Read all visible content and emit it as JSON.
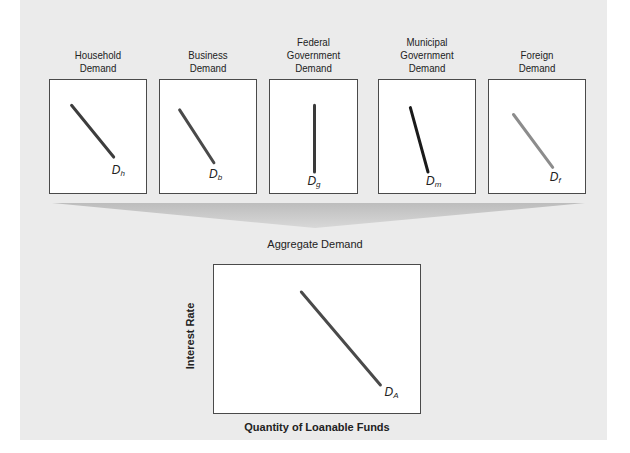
{
  "diagram": {
    "panels": [
      {
        "title_lines": [
          "Household",
          "Demand"
        ],
        "curve_label": "D",
        "curve_sub": "h",
        "curve_color": "#3d3d3d",
        "slope": "downward",
        "x1": 0.22,
        "y1": 0.22,
        "x2": 0.65,
        "y2": 0.67,
        "lx": 0.63,
        "ly": 0.72
      },
      {
        "title_lines": [
          "Business",
          "Demand"
        ],
        "curve_label": "D",
        "curve_sub": "b",
        "curve_color": "#4a4a4a",
        "slope": "downward",
        "x1": 0.2,
        "y1": 0.26,
        "x2": 0.55,
        "y2": 0.72,
        "lx": 0.5,
        "ly": 0.76
      },
      {
        "title_lines": [
          "Federal",
          "Government",
          "Demand"
        ],
        "curve_label": "D",
        "curve_sub": "g",
        "curve_color": "#3a3a3a",
        "slope": "vertical",
        "x1": 0.5,
        "y1": 0.22,
        "x2": 0.5,
        "y2": 0.8,
        "lx": 0.42,
        "ly": 0.82
      },
      {
        "title_lines": [
          "Municipal",
          "Government",
          "Demand"
        ],
        "curve_label": "D",
        "curve_sub": "m",
        "curve_color": "#1a1a1a",
        "slope": "steep-downward",
        "x1": 0.32,
        "y1": 0.24,
        "x2": 0.5,
        "y2": 0.8,
        "lx": 0.48,
        "ly": 0.82
      },
      {
        "title_lines": [
          "Foreign",
          "Demand"
        ],
        "curve_label": "D",
        "curve_sub": "f",
        "curve_color": "#8c8c8c",
        "slope": "downward",
        "x1": 0.25,
        "y1": 0.3,
        "x2": 0.65,
        "y2": 0.76,
        "lx": 0.62,
        "ly": 0.78
      }
    ],
    "aggregate": {
      "title": "Aggregate Demand",
      "ylabel": "Interest Rate",
      "xlabel": "Quantity of Loanable Funds",
      "curve_label": "D",
      "curve_sub": "A",
      "curve_color": "#4a4a4a",
      "x1": 0.42,
      "y1": 0.18,
      "x2": 0.8,
      "y2": 0.8,
      "lx": 0.82,
      "ly": 0.8
    },
    "colors": {
      "panel_bg": "#ebebeb",
      "arrow_light": "#e0e0e0",
      "arrow_dark": "#a8a8a8"
    }
  }
}
